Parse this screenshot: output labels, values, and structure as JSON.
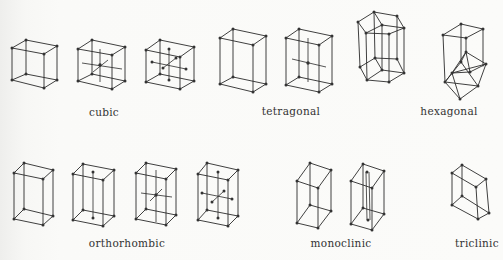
{
  "figure": {
    "colors": {
      "background": "#f9f9f7",
      "line": "#2a2a2a",
      "node": "#333333",
      "text": "#333333"
    },
    "groups": [
      {
        "id": "cubic",
        "label": "cubic",
        "cells": [
          "simple",
          "body-centered",
          "face-centered"
        ]
      },
      {
        "id": "tetragonal",
        "label": "tetragonal",
        "cells": [
          "simple",
          "body-centered"
        ]
      },
      {
        "id": "hexagonal",
        "label": "hexagonal",
        "cells": [
          "hexagonal-prism",
          "rhombohedral"
        ]
      },
      {
        "id": "orthorhombic",
        "label": "orthorhombic",
        "cells": [
          "simple",
          "base-centered",
          "body-centered",
          "face-centered"
        ]
      },
      {
        "id": "monoclinic",
        "label": "monoclinic",
        "cells": [
          "simple",
          "base-centered"
        ]
      },
      {
        "id": "triclinic",
        "label": "triclinic",
        "cells": [
          "simple"
        ]
      }
    ]
  }
}
